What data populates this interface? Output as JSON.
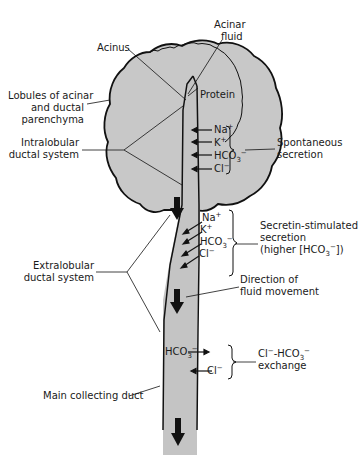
{
  "labels": {
    "acinus": "Acinus",
    "acinar_fluid_1": "Acinar",
    "acinar_fluid_2": "fluid",
    "lobules_1": "Lobules of acinar",
    "lobules_2": "and ductal",
    "lobules_3": "parenchyma",
    "protein": "Protein",
    "intralobular_1": "Intralobular",
    "intralobular_2": "ductal system",
    "spontaneous_1": "Spontaneous",
    "spontaneous_2": "secretion",
    "secretin_1": "Secretin-stimulated",
    "secretin_2": "secretion",
    "secretin_3": "(higher [HCO",
    "secretin_3_sub": "3",
    "secretin_3_sup": "−",
    "secretin_3_end": "])",
    "extralobular_1": "Extralobular",
    "extralobular_2": "ductal system",
    "direction_1": "Direction of",
    "direction_2": "fluid movement",
    "exchange_1a": "Cl",
    "exchange_1b": "−",
    "exchange_1c": "-HCO",
    "exchange_1d": "3",
    "exchange_1e": "−",
    "exchange_2": "exchange",
    "main_duct": "Main collecting duct"
  },
  "ions": {
    "spontaneous": [
      {
        "base": "Na",
        "sup": "+",
        "sub": ""
      },
      {
        "base": "K",
        "sup": "+",
        "sub": ""
      },
      {
        "base": "HCO",
        "sup": "−",
        "sub": "3"
      },
      {
        "base": "Cl",
        "sup": "−",
        "sub": ""
      }
    ],
    "secretin": [
      {
        "base": "Na",
        "sup": "+",
        "sub": ""
      },
      {
        "base": "K",
        "sup": "+",
        "sub": ""
      },
      {
        "base": "HCO",
        "sup": "−",
        "sub": "3"
      },
      {
        "base": "Cl",
        "sup": "−",
        "sub": ""
      }
    ],
    "exchange": [
      {
        "base": "HCO",
        "sup": "−",
        "sub": "3"
      },
      {
        "base": "Cl",
        "sup": "−",
        "sub": ""
      }
    ]
  },
  "colors": {
    "lobule_fill": "#c8c8c8",
    "duct_fill": "#c4c4c4",
    "outline": "#111111",
    "text": "#1a1a1a"
  }
}
